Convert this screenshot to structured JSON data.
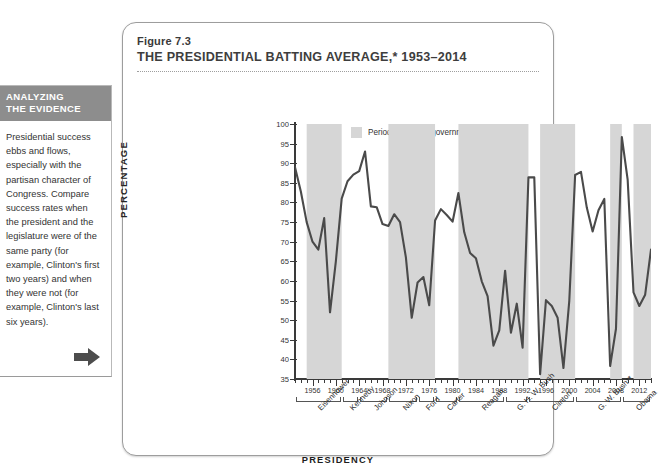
{
  "sidebar": {
    "heading_line1": "ANALYZING",
    "heading_line2": "THE EVIDENCE",
    "body": "Presidential success ebbs and flows, especially with the partisan character of Congress. Compare success rates when the president and the legislature were of the same party (for example, Clinton's first two years) and when they were not (for example, Clinton's last six years).",
    "next_icon": "right-arrow-icon"
  },
  "figure": {
    "number": "Figure 7.3",
    "title": "THE PRESIDENTIAL BATTING AVERAGE,* 1953–2014"
  },
  "legend": {
    "swatch_color": "#d6d6d6",
    "label": "Period of divided government"
  },
  "colors": {
    "line": "#4a4a4a",
    "band": "#d6d6d6",
    "axis": "#3a3a3a",
    "sidebar_header_bg": "#8d8d8d"
  },
  "chart_data": {
    "type": "line",
    "title": "THE PRESIDENTIAL BATTING AVERAGE,* 1953–2014",
    "xlabel": "PRESIDENCY",
    "ylabel": "PERCENTAGE",
    "xlim": [
      1953,
      2014
    ],
    "ylim": [
      35,
      100
    ],
    "ytick_step": 5,
    "yticks": [
      35,
      40,
      45,
      50,
      55,
      60,
      65,
      70,
      75,
      80,
      85,
      90,
      95,
      100
    ],
    "xticks": [
      1956,
      1960,
      1964,
      1968,
      1972,
      1976,
      1980,
      1984,
      1988,
      1992,
      1996,
      2000,
      2004,
      2008,
      2012
    ],
    "grid": false,
    "legend_position": "top-center",
    "series": [
      {
        "name": "Presidential success rate",
        "x": [
          1953,
          1954,
          1955,
          1956,
          1957,
          1958,
          1959,
          1960,
          1961,
          1962,
          1963,
          1964,
          1965,
          1966,
          1967,
          1968,
          1969,
          1970,
          1971,
          1972,
          1973,
          1974,
          1975,
          1976,
          1977,
          1978,
          1979,
          1980,
          1981,
          1982,
          1983,
          1984,
          1985,
          1986,
          1987,
          1988,
          1989,
          1990,
          1991,
          1992,
          1993,
          1994,
          1995,
          1996,
          1997,
          1998,
          1999,
          2000,
          2001,
          2002,
          2003,
          2004,
          2005,
          2006,
          2007,
          2008,
          2009,
          2010,
          2011,
          2012,
          2013,
          2014
        ],
        "values": [
          89.0,
          82.8,
          75.0,
          70.0,
          68.0,
          76.0,
          52.0,
          65.0,
          81.0,
          85.4,
          87.1,
          88.0,
          93.0,
          79.0,
          78.8,
          74.5,
          74.0,
          77.0,
          75.0,
          66.0,
          50.6,
          59.6,
          61.0,
          53.8,
          75.4,
          78.3,
          76.8,
          75.1,
          82.4,
          72.4,
          67.1,
          65.8,
          59.9,
          56.1,
          43.5,
          47.4,
          62.6,
          46.8,
          54.2,
          43.0,
          86.4,
          86.4,
          36.2,
          55.1,
          53.6,
          50.6,
          37.8,
          55.0,
          87.0,
          87.8,
          78.7,
          72.6,
          78.0,
          80.9,
          38.3,
          47.8,
          96.7,
          85.8,
          57.1,
          53.6,
          56.5,
          68.0
        ]
      }
    ],
    "shaded_bands": [
      {
        "label": "Period of divided government",
        "start": 1955,
        "end": 1961
      },
      {
        "label": "Period of divided government",
        "start": 1969,
        "end": 1977
      },
      {
        "label": "Period of divided government",
        "start": 1981,
        "end": 1993
      },
      {
        "label": "Period of divided government",
        "start": 1995,
        "end": 2001
      },
      {
        "label": "Period of divided government",
        "start": 2007,
        "end": 2009
      },
      {
        "label": "Period of divided government",
        "start": 2011,
        "end": 2014
      }
    ],
    "presidents": [
      {
        "name": "Eisenhower",
        "start": 1953,
        "end": 1961
      },
      {
        "name": "Kennedy",
        "start": 1961,
        "end": 1964
      },
      {
        "name": "Johnson",
        "start": 1964,
        "end": 1969
      },
      {
        "name": "Nixon",
        "start": 1969,
        "end": 1974
      },
      {
        "name": "Ford",
        "start": 1974,
        "end": 1977
      },
      {
        "name": "Carter",
        "start": 1977,
        "end": 1981
      },
      {
        "name": "Reagan",
        "start": 1981,
        "end": 1989
      },
      {
        "name": "G. H. W. Bush",
        "start": 1989,
        "end": 1993
      },
      {
        "name": "Clinton",
        "start": 1993,
        "end": 2001
      },
      {
        "name": "G. W. Bush**",
        "start": 2001,
        "end": 2009
      },
      {
        "name": "Obama",
        "start": 2009,
        "end": 2014
      }
    ]
  }
}
